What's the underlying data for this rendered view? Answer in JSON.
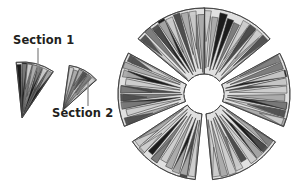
{
  "figure": {
    "type": "pinwheel-hierarchical-pie-diagram",
    "background": "#ffffff",
    "callouts": [
      {
        "id": "section-1",
        "label": "Section 1",
        "label_x": 13,
        "label_y": 35,
        "leader": {
          "x1": 38,
          "y1": 48,
          "x2": 38,
          "y2": 72,
          "color": "#8a8a8a",
          "width": 1.3
        },
        "wedge": {
          "apex_x": 22,
          "apex_y": 118,
          "r_in": 0,
          "r_out": 56,
          "a0": -96,
          "a1": -56,
          "dominant_shade": "#1c1c1c"
        }
      },
      {
        "id": "section-2",
        "label": "Section 2",
        "label_x": 52,
        "label_y": 108,
        "leader": {
          "x1": 88,
          "y1": 106,
          "x2": 88,
          "y2": 82,
          "color": "#8a8a8a",
          "width": 1.3
        },
        "wedge": {
          "apex_x": 63,
          "apex_y": 110,
          "r_in": 0,
          "r_out": 45,
          "a0": -82,
          "a1": -42,
          "dominant_shade": "#cfcfcf"
        }
      }
    ],
    "main_chart": {
      "center_x": 204,
      "center_y": 94,
      "radius_outer": 86,
      "hub_radius": 20,
      "sector_count": 6,
      "swirl_offset_deg": 17,
      "gap_deg": 3.5,
      "slices_per_sector": 9,
      "stroke": "#3a3a3a",
      "stroke_width": 0.7
    },
    "palette": {
      "black": "#1c1c1c",
      "dark_gray": "#4d4d4d",
      "mid_gray": "#7d7d7d",
      "light_gray": "#ababab",
      "pale_gray": "#cdcdcd",
      "very_pale": "#e0e0e0",
      "white": "#ffffff",
      "outline": "#3a3a3a",
      "leader_line": "#8a8a8a",
      "text": "#231f20"
    },
    "sectors": [
      {
        "index": 0,
        "start_deg": 268,
        "end_deg": 322,
        "shades": [
          "pale_gray",
          "light_gray",
          "black",
          "black",
          "mid_gray",
          "pale_gray",
          "dark_gray",
          "light_gray",
          "pale_gray"
        ]
      },
      {
        "index": 1,
        "start_deg": 328,
        "end_deg": 382,
        "shades": [
          "pale_gray",
          "mid_gray",
          "black",
          "dark_gray",
          "pale_gray",
          "light_gray",
          "black",
          "pale_gray",
          "light_gray"
        ]
      },
      {
        "index": 2,
        "start_deg": 28,
        "end_deg": 82,
        "shades": [
          "light_gray",
          "black",
          "black",
          "pale_gray",
          "dark_gray",
          "mid_gray",
          "pale_gray",
          "light_gray",
          "pale_gray"
        ]
      },
      {
        "index": 3,
        "start_deg": 88,
        "end_deg": 142,
        "shades": [
          "pale_gray",
          "dark_gray",
          "black",
          "light_gray",
          "pale_gray",
          "mid_gray",
          "black",
          "pale_gray",
          "light_gray"
        ]
      },
      {
        "index": 4,
        "start_deg": 148,
        "end_deg": 202,
        "shades": [
          "light_gray",
          "pale_gray",
          "black",
          "mid_gray",
          "dark_gray",
          "pale_gray",
          "black",
          "light_gray",
          "pale_gray"
        ]
      },
      {
        "index": 5,
        "start_deg": 208,
        "end_deg": 262,
        "shades": [
          "pale_gray",
          "mid_gray",
          "black",
          "black",
          "light_gray",
          "dark_gray",
          "pale_gray",
          "mid_gray",
          "light_gray"
        ]
      }
    ]
  }
}
